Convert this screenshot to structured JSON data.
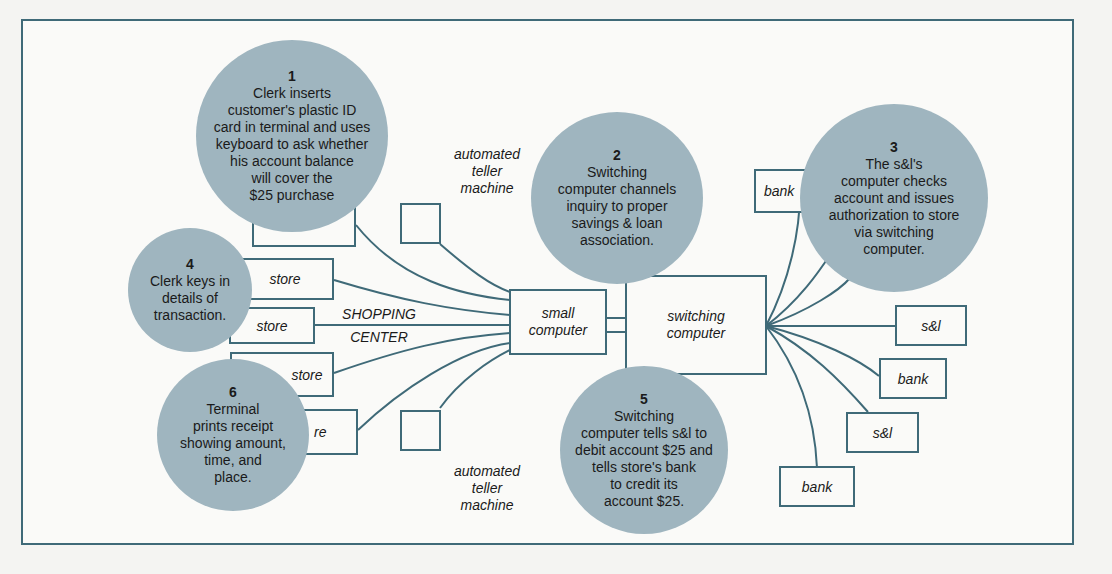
{
  "steps": [
    {
      "number": "1",
      "text": "Clerk inserts\ncustomer's plastic ID\ncard in terminal and uses\nkeyboard to ask whether\nhis account balance\nwill cover the\n$25 purchase"
    },
    {
      "number": "2",
      "text": "Switching\ncomputer channels\ninquiry to proper\nsavings & loan\nassociation."
    },
    {
      "number": "3",
      "text": "The s&l's\ncomputer checks\naccount and issues\nauthorization to store\nvia switching\ncomputer."
    },
    {
      "number": "4",
      "text": "Clerk keys in\ndetails of\ntransaction."
    },
    {
      "number": "5",
      "text": "Switching\ncomputer tells s&l to\ndebit account $25 and\ntells store's bank\nto credit its\naccount $25."
    },
    {
      "number": "6",
      "text": "Terminal\nprints receipt\nshowing amount,\ntime, and\nplace."
    }
  ],
  "nodes": {
    "stores": [
      "store",
      "store",
      "store",
      "re"
    ],
    "small_computer": "small\ncomputer",
    "switching_computer": "switching\ncomputer",
    "institutions": [
      "bank",
      "s&l",
      "bank",
      "s&l",
      "bank"
    ]
  },
  "labels": {
    "atm_top": "automated\nteller\nmachine",
    "atm_bottom": "automated\nteller\nmachine",
    "shopping_center_1": "SHOPPING",
    "shopping_center_2": "CENTER"
  },
  "colors": {
    "line": "#3f6a78",
    "bubble": "#9fb5bf"
  }
}
